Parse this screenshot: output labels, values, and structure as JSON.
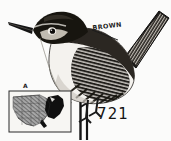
{
  "plate": {
    "kind": "field-guide-bird-illustration",
    "background_color": "#fbfbfa",
    "ink_color": "#1b1b1b",
    "subject": "wren perched on vertical stem",
    "plate_number": "721"
  },
  "annotations": {
    "plumage_label": "BROWN",
    "map_letter": "A"
  },
  "range_map": {
    "region": "United States",
    "breeding_fill_color": "#101010",
    "other_fill_color": "#9a9a9a",
    "frame_color": "#2a2a2a"
  },
  "bird": {
    "crown_color": "#161616",
    "back_color": "#2e2a26",
    "underpart_color": "#f4f2ee",
    "bill_color": "#141414",
    "tail_color": "#1d1b19",
    "leg_color": "#1a1a1a"
  },
  "perch": {
    "stem_color": "#141414"
  }
}
